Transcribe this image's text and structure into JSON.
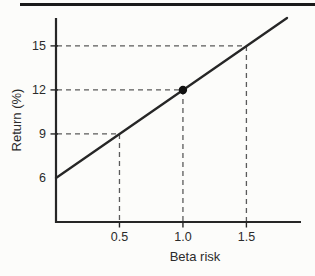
{
  "figure": {
    "background": "#fcfcfa",
    "top_rule_color": "#1a1a1a"
  },
  "chart_data": {
    "type": "line",
    "title": "",
    "xlabel": "Beta risk",
    "ylabel": "Return (%)",
    "xlim": [
      0,
      1.93
    ],
    "ylim": [
      3.0,
      16.9
    ],
    "grid": false,
    "legend": null,
    "axis_color": "#262626",
    "guide_color": "#5a5a5a",
    "x_ticks": [
      {
        "value": 0.5,
        "label": "0.5"
      },
      {
        "value": 1.0,
        "label": "1.0"
      },
      {
        "value": 1.5,
        "label": "1.5"
      }
    ],
    "y_ticks": [
      {
        "value": 6,
        "label": "6",
        "tick_mark": false
      },
      {
        "value": 9,
        "label": "9",
        "tick_mark": true
      },
      {
        "value": 12,
        "label": "12",
        "tick_mark": true
      },
      {
        "value": 15,
        "label": "15",
        "tick_mark": true
      }
    ],
    "series": [
      {
        "name": "security-market-line",
        "color": "#262626",
        "points": [
          {
            "x": 0.0,
            "y": 6.0
          },
          {
            "x": 1.82,
            "y": 16.9
          }
        ],
        "intercept_pct": 6,
        "slope_pct_per_beta": 6
      }
    ],
    "marker_point": {
      "x": 1.0,
      "y": 12,
      "color": "#111111"
    },
    "guide_lines": [
      {
        "x": 0.5,
        "y": 9
      },
      {
        "x": 1.0,
        "y": 12
      },
      {
        "x": 1.5,
        "y": 15
      }
    ]
  }
}
